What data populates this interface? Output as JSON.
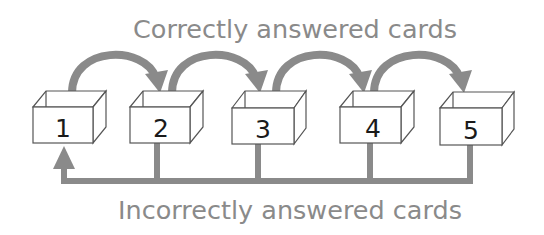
{
  "diagram": {
    "title_top": "Correctly answered cards",
    "title_bottom": "Incorrectly answered cards",
    "colors": {
      "arrow": "#8a8a8a",
      "box_stroke": "#555555",
      "label": "#8a8a8a",
      "number": "#1a1a1a"
    },
    "boxes": [
      {
        "id": 1,
        "label": "1"
      },
      {
        "id": 2,
        "label": "2"
      },
      {
        "id": 3,
        "label": "3"
      },
      {
        "id": 4,
        "label": "4"
      },
      {
        "id": 5,
        "label": "5"
      }
    ],
    "forward_arrows": [
      {
        "from": "1",
        "to": "2"
      },
      {
        "from": "2",
        "to": "3"
      },
      {
        "from": "3",
        "to": "4"
      },
      {
        "from": "4",
        "to": "5"
      }
    ],
    "return_path": {
      "from": [
        "2",
        "3",
        "4",
        "5"
      ],
      "to": "1"
    }
  }
}
